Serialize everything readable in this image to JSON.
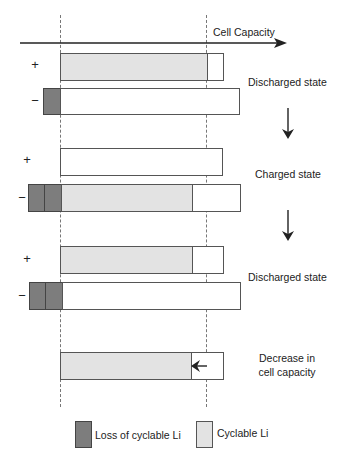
{
  "axis": {
    "label": "Cell Capacity"
  },
  "electrodes": {
    "positive_symbol": "+",
    "negative_symbol": "−"
  },
  "stages": [
    {
      "label": "Discharged state"
    },
    {
      "label": "Charged state"
    },
    {
      "label": "Discharged state"
    },
    {
      "label_line1": "Decrease in",
      "label_line2": "cell capacity"
    }
  ],
  "legend": {
    "items": [
      {
        "label": "Loss of cyclable Li",
        "color": "#7d7d7d"
      },
      {
        "label": "Cyclable Li",
        "color": "#e3e3e3"
      }
    ]
  },
  "colors": {
    "loss_of_cyclable_li": "#7d7d7d",
    "cyclable_li": "#e3e3e3",
    "outline": "#555555"
  }
}
